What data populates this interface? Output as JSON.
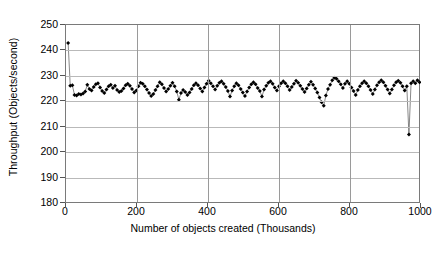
{
  "chart_data": {
    "type": "scatter",
    "title": "",
    "xlabel": "Number of objects created (Thousands)",
    "ylabel": "Throughput (Objects/second)",
    "xlim": [
      0,
      1000
    ],
    "ylim": [
      180,
      250
    ],
    "xticks": [
      0,
      200,
      400,
      600,
      800,
      1000
    ],
    "yticks": [
      180,
      190,
      200,
      210,
      220,
      230,
      240,
      250
    ],
    "grid": "horizontal-and-vertical",
    "legend": "none",
    "marker": "filled-diamond",
    "marker_color": "#000000",
    "line_color": "#555555",
    "series_name": "Throughput",
    "x": [
      6,
      12,
      18,
      24,
      30,
      36,
      42,
      48,
      54,
      60,
      66,
      72,
      78,
      84,
      90,
      96,
      102,
      108,
      114,
      120,
      126,
      132,
      138,
      144,
      150,
      156,
      162,
      168,
      174,
      180,
      186,
      192,
      198,
      204,
      210,
      216,
      222,
      228,
      234,
      240,
      246,
      252,
      258,
      264,
      270,
      276,
      282,
      288,
      294,
      300,
      306,
      312,
      318,
      324,
      330,
      336,
      342,
      348,
      354,
      360,
      366,
      372,
      378,
      384,
      390,
      396,
      402,
      408,
      414,
      420,
      426,
      432,
      438,
      444,
      450,
      456,
      462,
      468,
      474,
      480,
      486,
      492,
      498,
      504,
      510,
      516,
      522,
      528,
      534,
      540,
      546,
      552,
      558,
      564,
      570,
      576,
      582,
      588,
      594,
      600,
      606,
      612,
      618,
      624,
      630,
      636,
      642,
      648,
      654,
      660,
      666,
      672,
      678,
      684,
      690,
      696,
      702,
      708,
      714,
      720,
      726,
      732,
      738,
      744,
      750,
      756,
      762,
      768,
      774,
      780,
      786,
      792,
      798,
      804,
      810,
      816,
      822,
      828,
      834,
      840,
      846,
      852,
      858,
      864,
      870,
      876,
      882,
      888,
      894,
      900,
      906,
      912,
      918,
      924,
      930,
      936,
      942,
      948,
      954,
      960,
      966,
      972,
      978,
      984,
      990,
      996
    ],
    "y": [
      243.0,
      226.2,
      226.4,
      222.6,
      222.4,
      223.0,
      222.8,
      223.2,
      224.0,
      226.6,
      225.0,
      224.4,
      225.8,
      226.8,
      227.2,
      225.6,
      224.2,
      223.4,
      224.8,
      226.0,
      226.6,
      225.4,
      226.2,
      224.6,
      223.8,
      224.2,
      225.2,
      226.4,
      227.0,
      226.2,
      225.0,
      223.6,
      224.4,
      226.0,
      227.4,
      227.0,
      226.0,
      224.8,
      223.4,
      222.2,
      223.0,
      224.6,
      226.0,
      227.6,
      226.8,
      225.4,
      224.0,
      225.0,
      226.2,
      227.4,
      226.0,
      224.0,
      220.8,
      223.4,
      224.6,
      223.8,
      222.6,
      223.6,
      225.0,
      226.4,
      227.2,
      226.4,
      225.2,
      224.0,
      225.6,
      227.0,
      228.2,
      227.2,
      226.0,
      224.8,
      226.2,
      227.4,
      228.0,
      227.0,
      225.8,
      224.2,
      222.0,
      224.4,
      226.0,
      227.2,
      226.4,
      225.0,
      223.6,
      222.2,
      224.0,
      225.6,
      226.8,
      227.6,
      226.8,
      225.4,
      224.2,
      222.0,
      224.8,
      226.2,
      227.4,
      228.0,
      227.0,
      225.6,
      224.4,
      226.0,
      227.2,
      228.0,
      227.2,
      226.0,
      224.6,
      225.8,
      227.0,
      228.2,
      227.4,
      226.2,
      225.0,
      223.8,
      225.2,
      226.6,
      227.8,
      226.6,
      225.2,
      223.6,
      221.6,
      219.8,
      218.4,
      222.4,
      225.0,
      226.6,
      228.4,
      229.4,
      229.0,
      228.0,
      226.8,
      225.4,
      227.0,
      228.0,
      227.0,
      225.6,
      224.2,
      222.6,
      224.6,
      226.0,
      227.2,
      228.0,
      227.2,
      226.0,
      224.6,
      223.0,
      224.8,
      226.4,
      227.6,
      228.4,
      227.6,
      226.2,
      224.8,
      223.2,
      224.8,
      226.4,
      227.6,
      228.2,
      227.4,
      226.0,
      224.4,
      226.0,
      207.2,
      227.2,
      228.0,
      227.2,
      228.4,
      227.6
    ],
    "annotations": {
      "initial_spike": {
        "x": 6,
        "y": 243.0,
        "note": "startup peak"
      },
      "deep_dip": {
        "x": 966,
        "y": 207.2,
        "note": "single large drop"
      },
      "steady_band": {
        "min": 220,
        "max": 230,
        "note": "most points lie between 220 and 230"
      }
    }
  },
  "axes": {
    "y_tick_labels": [
      "250",
      "240",
      "230",
      "220",
      "210",
      "200",
      "190",
      "180"
    ],
    "x_tick_labels": [
      "0",
      "200",
      "400",
      "600",
      "800",
      "1000"
    ]
  },
  "labels": {
    "xlabel": "Number of objects created (Thousands)",
    "ylabel": "Throughput (Objects/second)",
    "caption": ""
  }
}
